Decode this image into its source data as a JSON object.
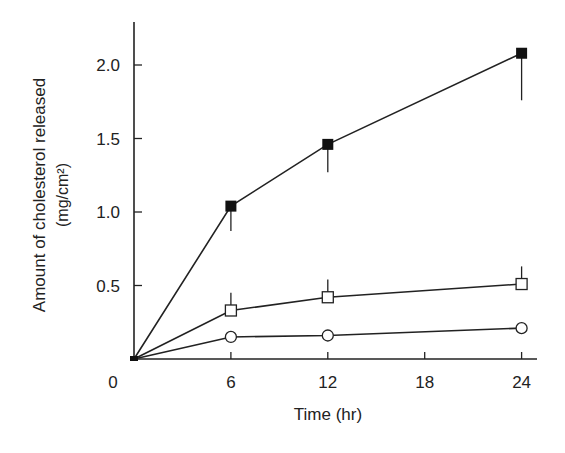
{
  "chart_data": {
    "type": "line",
    "title": "",
    "xlabel": "Time (hr)",
    "ylabel": "Amount of cholesterol released",
    "ylabel_units": "(mg/cm²)",
    "x": [
      0,
      6,
      12,
      24
    ],
    "xticks": [
      "0",
      "6",
      "12",
      "18",
      "24"
    ],
    "yticks": [
      "0.5",
      "1.0",
      "1.5",
      "2.0"
    ],
    "xlim": [
      0,
      25
    ],
    "ylim": [
      0,
      2.3
    ],
    "grid": false,
    "legend": null,
    "series": [
      {
        "name": "filled-square",
        "marker": "filled-square",
        "values": [
          0,
          1.04,
          1.46,
          2.08
        ],
        "error_down": [
          0,
          0.17,
          0.19,
          0.32
        ]
      },
      {
        "name": "open-square",
        "marker": "open-square",
        "values": [
          0,
          0.33,
          0.42,
          0.51
        ],
        "error_up": [
          0,
          0.12,
          0.12,
          0.12
        ]
      },
      {
        "name": "open-circle",
        "marker": "open-circle",
        "values": [
          0,
          0.15,
          0.16,
          0.21
        ]
      }
    ]
  }
}
